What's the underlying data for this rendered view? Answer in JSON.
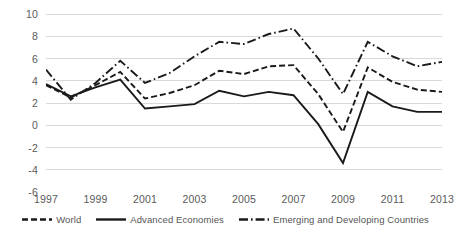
{
  "chart_data": {
    "type": "line",
    "title": "",
    "subtitle": "",
    "xlabel": "",
    "ylabel": "",
    "xlim": [
      1997,
      2013
    ],
    "ylim": [
      -6,
      10
    ],
    "ytick_values": [
      10,
      8,
      6,
      4,
      2,
      0,
      -2,
      -4,
      -6
    ],
    "ytick_labels": [
      "10",
      "8",
      "6",
      "4",
      "2",
      "0",
      "-2",
      "-4",
      "-6"
    ],
    "xtick_values": [
      1997,
      1999,
      2001,
      2003,
      2005,
      2007,
      2009,
      2011,
      2013
    ],
    "xtick_labels": [
      "1997",
      "1999",
      "2001",
      "2003",
      "2005",
      "2007",
      "2009",
      "2011",
      "2013"
    ],
    "grid": "horizontal",
    "legend_position": "bottom",
    "x": [
      1997,
      1998,
      1999,
      2000,
      2001,
      2002,
      2003,
      2004,
      2005,
      2006,
      2007,
      2008,
      2009,
      2010,
      2011,
      2012,
      2013
    ],
    "series": [
      {
        "name": "World",
        "style": "dashed",
        "color": "#1a1a1a",
        "values": [
          3.6,
          2.5,
          3.6,
          4.8,
          2.4,
          2.9,
          3.6,
          4.9,
          4.6,
          5.3,
          5.4,
          2.8,
          -0.6,
          5.2,
          3.9,
          3.2,
          3.0
        ]
      },
      {
        "name": "Advanced Economies",
        "style": "solid",
        "color": "#1a1a1a",
        "values": [
          3.7,
          2.6,
          3.4,
          4.1,
          1.5,
          1.7,
          1.9,
          3.1,
          2.6,
          3.0,
          2.7,
          0.1,
          -3.4,
          3.0,
          1.7,
          1.2,
          1.2
        ]
      },
      {
        "name": "Emerging and Developing Countries",
        "style": "dash-dot",
        "color": "#1a1a1a",
        "values": [
          5.0,
          2.3,
          3.8,
          5.8,
          3.8,
          4.7,
          6.2,
          7.5,
          7.3,
          8.2,
          8.7,
          6.0,
          2.8,
          7.5,
          6.2,
          5.3,
          5.7
        ]
      }
    ],
    "colors": {
      "axis_text": "#5a5a5a",
      "grid": "#d9d9d9",
      "line": "#1a1a1a",
      "background": "#ffffff"
    }
  }
}
